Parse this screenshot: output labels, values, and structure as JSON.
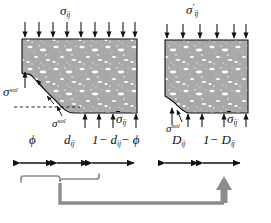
{
  "figure": {
    "kind": "continuum-damage-mechanics-schematic",
    "background_color": "#ffffff",
    "stroke_color": "#111111",
    "matrix_fill": "#a9a9a9",
    "gray_arrow_color": "#888888"
  },
  "labels": {
    "top_left_stress": {
      "base": "σ",
      "sub": "ij",
      "prime": ""
    },
    "top_right_stress": {
      "base": "σ",
      "sub": "ij",
      "prime": "′"
    },
    "left_sol_upper": {
      "base": "σ",
      "sup": "sol"
    },
    "left_sol_lower": {
      "base": "σ",
      "sup": "sol"
    },
    "right_sol": {
      "base": "σ",
      "sup": "sol"
    },
    "bottom_left_bar_stress": {
      "base": "σ",
      "sub": "ij",
      "overbar": true
    },
    "bottom_right_bar_stress": {
      "base": "σ",
      "sub": "ij",
      "overbar": true
    }
  },
  "scale_left": {
    "segments": [
      {
        "id": "phi",
        "text": "ϕ",
        "kind": "symbol"
      },
      {
        "id": "d-ij",
        "base": "d",
        "sub": "ij",
        "kind": "subscripted"
      },
      {
        "id": "one-minus-d-minus-phi",
        "text": "1− d",
        "sub": "ij",
        "tail": "− ϕ",
        "kind": "expression"
      }
    ]
  },
  "scale_right": {
    "segments": [
      {
        "id": "D-ij",
        "base": "D",
        "sub": "ij",
        "kind": "subscripted"
      },
      {
        "id": "one-minus-D-ij",
        "text": "1− D",
        "sub": "ij",
        "kind": "expression"
      }
    ]
  },
  "mapping_arrow": {
    "type": "brace-to-arrow",
    "meaning": "left two segments (porosity + damage) map to right first segment",
    "color": "#8c8c8c"
  }
}
